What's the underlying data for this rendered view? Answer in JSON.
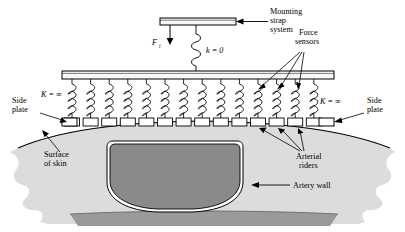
{
  "figure": {
    "name": "arterial-tonometer-schematic",
    "colors": {
      "skin": "#dcdcdc",
      "skin_edge": "#000000",
      "deep_tissue": "#9a9a9a",
      "artery_lumen": "#8a8a8a",
      "artery_wall": "#ffffff",
      "plate_fill": "#f2f2f2",
      "line": "#000000"
    }
  },
  "labels": {
    "mounting_strap": "Mounting\nstrap\nsystem",
    "mounting_strap_lines": [
      "Mounting",
      "strap",
      "system"
    ],
    "force_sensors_lines": [
      "Force",
      "sensors"
    ],
    "applied_force": "F",
    "applied_force_sub": "i",
    "spring_constant_zero": "k = 0",
    "stiffness_left": "K = ∞",
    "stiffness_right": "K = ∞",
    "side_plate_left_lines": [
      "Side",
      "plate"
    ],
    "side_plate_right_lines": [
      "Side",
      "plate"
    ],
    "surface_of_skin_lines": [
      "Surface",
      "of skin"
    ],
    "arterial_riders_lines": [
      "Arterial",
      "riders"
    ],
    "artery_wall": "Artery wall"
  },
  "diagram_data": {
    "type": "schematic",
    "strap_bar": {
      "x": 160,
      "y": 18,
      "width": 76,
      "height": 7
    },
    "main_plate": {
      "x": 62,
      "y": 71,
      "width": 272,
      "height": 8
    },
    "center_spring": {
      "x": 196,
      "y_top": 25,
      "y_bottom": 71,
      "label": "k = 0"
    },
    "force_arrow": {
      "x": 170,
      "y_top": 25,
      "y_bottom": 44
    },
    "spring_count": 14,
    "spring_first_x": 72,
    "spring_pitch": 18.6,
    "spring_top_y": 79,
    "spring_bottom_y": 118,
    "rider_count": 14,
    "rider_width": 15,
    "rider_height": 8,
    "rider_y": 118,
    "force_sensor_arrow_targets": [
      259,
      278,
      296
    ],
    "arterial_rider_arrow_targets": [
      259,
      278,
      296
    ],
    "artery": {
      "cx": 175,
      "top_y": 140,
      "bottom_y": 211,
      "half_width": 62
    },
    "skin_top_left_x": 18,
    "skin_top_right_x": 390,
    "deep_band": {
      "y": 214,
      "x_left": 80,
      "x_right": 330
    }
  }
}
